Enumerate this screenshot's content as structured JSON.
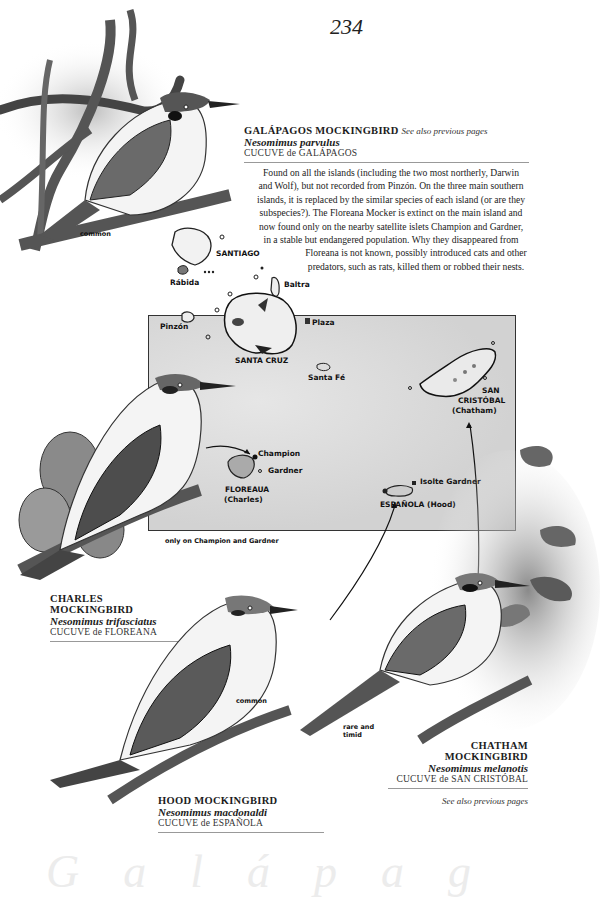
{
  "page": {
    "number": "234",
    "watermark": "Galápag"
  },
  "entries": [
    {
      "id": "galapagos",
      "title": "GALÁPAGOS MOCKINGBIRD",
      "see_also": "See also previous pages",
      "scientific": "Nesomimus parvulus",
      "local_name": "CUCUVE de GALÁPAGOS",
      "note": "common",
      "description": "Found on all the islands (including the two most northerly, Darwin and Wolf), but not recorded from Pinzón. On the three main southern islands, it is replaced by the similar species of each island (or are they subspecies?). The Floreana Mocker is extinct on the main island and now found only on the nearby satellite islets Champion and Gardner, in a stable but endangered population. Why they disappeared from Floreana is not known, possibly introduced cats and other predators, such as rats, killed them or robbed their nests.",
      "description_lines": [
        "Found on all the islands (including the two most northerly, Darwin",
        "and Wolf), but not recorded from Pinzón. On the three main southern",
        "islands, it is replaced by the similar species of each island (or are they",
        "subspecies?). The Floreana Mocker is extinct on the main island and",
        "now found only on the nearby satellite islets Champion and Gardner,",
        "in a stable but endangered population. Why they disappeared from",
        "Floreana is not known, possibly introduced cats and other",
        "predators, such as rats, killed them or robbed their nests."
      ]
    },
    {
      "id": "charles",
      "title": "CHARLES MOCKINGBIRD",
      "scientific": "Nesomimus trifasciatus",
      "local_name": "CUCUVE de FLOREANA",
      "note": "only on Champion and Gardner"
    },
    {
      "id": "hood",
      "title": "HOOD MOCKINGBIRD",
      "scientific": "Nesomimus macdonaldi",
      "local_name": "CUCUVE de ESPAÑOLA",
      "note": "common"
    },
    {
      "id": "chatham",
      "title_line1": "CHATHAM",
      "title_line2": "MOCKINGBIRD",
      "scientific": "Nesomimus melanotis",
      "local_name": "CUCUVE de SAN CRISTÓBAL",
      "see_also": "See also previous pages",
      "note_line1": "rare and",
      "note_line2": "timid"
    }
  ],
  "map": {
    "labels": {
      "santiago": "SANTIAGO",
      "rabida": "Rábida",
      "baltra": "Baltra",
      "pinzon": "Pinzón",
      "plaza": "Plaza",
      "santa_cruz": "SANTA CRUZ",
      "santa_fe": "Santa Fé",
      "san_cristobal_1": "SAN",
      "san_cristobal_2": "CRISTÓBAL",
      "san_cristobal_3": "(Chatham)",
      "champion": "Champion",
      "gardner": "Gardner",
      "floreana_1": "FLOREAUA",
      "floreana_2": "(Charles)",
      "isolte_gardner": "Isolte Gardner",
      "espanola": "ESPAÑOLA (Hood)"
    }
  }
}
